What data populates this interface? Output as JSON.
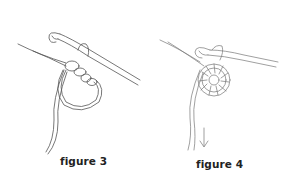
{
  "figures": [
    {
      "id": "figure-3",
      "caption": "figure 3",
      "depicts": "crochet hook with yarn loop and first chain stitches around a magic ring"
    },
    {
      "id": "figure-4",
      "caption": "figure 4",
      "depicts": "crochet hook with completed round of stitches in ring, tail pulled down (arrow)"
    }
  ],
  "colors": {
    "line": "#444444",
    "background": "#ffffff"
  }
}
